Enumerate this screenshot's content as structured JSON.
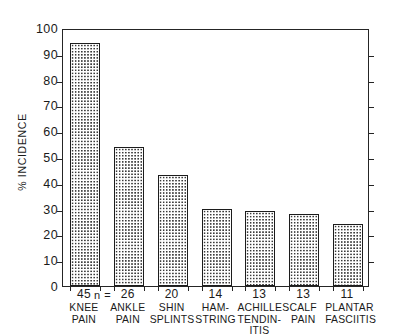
{
  "chart_data": {
    "type": "bar",
    "title": "",
    "subtitle": "",
    "xlabel": "",
    "ylabel": "% INCIDENCE",
    "ylim": [
      0,
      100
    ],
    "ytick_interval": 10,
    "yticks": [
      "0",
      "10",
      "20",
      "30",
      "40",
      "50",
      "60",
      "70",
      "80",
      "90",
      "100"
    ],
    "grid": false,
    "legend": "none",
    "n_prefix": "n =",
    "categories": [
      "KNEE\nPAIN",
      "ANKLE\nPAIN",
      "SHIN\nSPLINTS",
      "HAM-\nSTRING",
      "ACHILLES\nTENDIN-\nITIS",
      "CALF\nPAIN",
      "PLANTAR\nFASCIITIS"
    ],
    "n_values": [
      "45",
      "26",
      "20",
      "14",
      "13",
      "13",
      "11"
    ],
    "values": [
      94,
      54,
      43,
      30,
      29,
      28,
      24
    ],
    "bars": [
      {
        "label": "KNEE\nPAIN",
        "n": "45",
        "value": 94
      },
      {
        "label": "ANKLE\nPAIN",
        "n": "26",
        "value": 54
      },
      {
        "label": "SHIN\nSPLINTS",
        "n": "20",
        "value": 43
      },
      {
        "label": "HAM-\nSTRING",
        "n": "14",
        "value": 30
      },
      {
        "label": "ACHILLES\nTENDIN-\nITIS",
        "n": "13",
        "value": 29
      },
      {
        "label": "CALF\nPAIN",
        "n": "13",
        "value": 28
      },
      {
        "label": "PLANTAR\nFASCIITIS",
        "n": "11",
        "value": 24
      }
    ],
    "colors": {
      "axis": "#252525",
      "bar_outline": "#1c1c1c",
      "bar_fill_pattern": "#3a3a3a",
      "background": "#ffffff",
      "text": "#1a1a1a"
    }
  }
}
